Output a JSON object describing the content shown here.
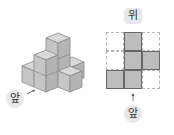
{
  "left_figure": {
    "front_label": "앞",
    "description": "isometric stack of unit cubes"
  },
  "right_figure": {
    "top_label": "위",
    "front_label": "앞",
    "grid": {
      "rows": 3,
      "cols": 3,
      "filled": [
        [
          0,
          1
        ],
        [
          1,
          1
        ],
        [
          1,
          2
        ],
        [
          2,
          0
        ],
        [
          2,
          1
        ]
      ]
    }
  },
  "colors": {
    "cube_face": "#c4c4c4",
    "cube_top": "#d6d6d6",
    "cube_edge": "#888888",
    "grid_fill": "#bdbdbd",
    "label_bg": "#e8e8e8"
  }
}
